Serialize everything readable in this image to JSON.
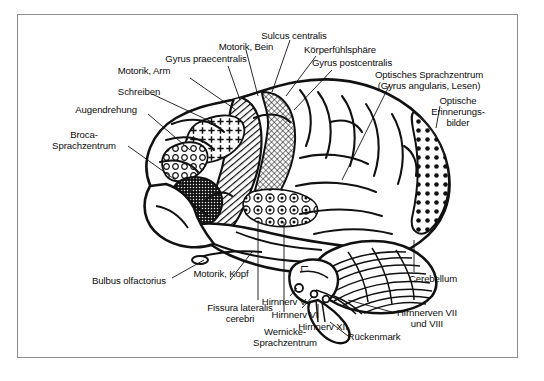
{
  "figure": {
    "language": "de",
    "frame_color": "#8d8d8d",
    "background_color": "#ffffff",
    "ink_color": "#0d0d0d"
  },
  "labels": {
    "motorik_bein": "Motorik, Bein",
    "gyrus_praecentralis": "Gyrus praecentralis",
    "motorik_arm": "Motorik, Arm",
    "schreiben": "Schreiben",
    "augendrehung": "Augendrehung",
    "broca": "Broca-\nSprachzentrum",
    "sulcus_centralis": "Sulcus centralis",
    "koerperfuehlsphaere": "Körperfühlsphäre",
    "gyrus_postcentralis": "Gyrus postcentralis",
    "optisches_sprachzentrum": "Optisches Sprachzentrum\n(Gyrus angularis, Lesen)",
    "optische_erinnerungsbilder": "Optische\nErinnerungs-\nbilder",
    "bulbus_olfactorius": "Bulbus olfactorius",
    "motorik_kopf": "Motorik, Kopf",
    "fissura_lateralis": "Fissura lateralis\ncerebri",
    "wernicke": "Wernicke-\nSprachzentrum",
    "hirnnerv_v": "Hirnnerv V",
    "hirnnerv_vi": "Hirnnerv VI",
    "hirnnerv_xii": "Hirnnerv XII",
    "hirnnerven_vii_viii": "Hirnnerven VII\nund VIII",
    "rueckenmark": "Rückenmark",
    "cerebellum": "Cerebellum"
  },
  "regions": [
    {
      "name": "gyrus-praecentralis",
      "fill": "diagonal-hatch",
      "label_ref": "gyrus_praecentralis"
    },
    {
      "name": "gyrus-postcentralis",
      "fill": "fine-stipple",
      "label_ref": "gyrus_postcentralis"
    },
    {
      "name": "schreiben-area",
      "fill": "plus-signs",
      "label_ref": "schreiben"
    },
    {
      "name": "augendrehung-area",
      "fill": "open-circles",
      "label_ref": "augendrehung"
    },
    {
      "name": "broca-area",
      "fill": "dense-dark-stipple",
      "label_ref": "broca"
    },
    {
      "name": "wernicke-area",
      "fill": "circled-dots",
      "label_ref": "wernicke"
    },
    {
      "name": "optische-erinnerungsbilder-area",
      "fill": "solid-dots",
      "label_ref": "optische_erinnerungsbilder"
    },
    {
      "name": "cerebellum-area",
      "fill": "parallel-foliation",
      "label_ref": "cerebellum"
    }
  ]
}
